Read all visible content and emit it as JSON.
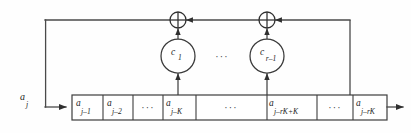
{
  "figure": {
    "type": "block-diagram",
    "background_color": "#fefefe",
    "line_color": "#4a4a4a",
    "text_color": "#1d1d1d"
  },
  "input_signal": {
    "base": "a",
    "subscript": "j",
    "label": "a_j"
  },
  "shift_register": {
    "name": "delay-line",
    "cells": [
      {
        "id": "cell-1",
        "base": "a",
        "subscript": "j–1",
        "kind": "value",
        "x": 72,
        "width": 31
      },
      {
        "id": "cell-2",
        "base": "a",
        "subscript": "j–2",
        "kind": "value",
        "x": 103,
        "width": 30
      },
      {
        "id": "cell-3",
        "base": "",
        "subscript": "",
        "kind": "ellipsis",
        "glyph": "···",
        "x": 133,
        "width": 30
      },
      {
        "id": "cell-4",
        "base": "a",
        "subscript": "j–K",
        "kind": "value",
        "x": 163,
        "width": 33
      },
      {
        "id": "cell-5",
        "base": "",
        "subscript": "",
        "kind": "ellipsis",
        "glyph": "···",
        "x": 196,
        "width": 71
      },
      {
        "id": "cell-6",
        "base": "a",
        "subscript": "j–rK+K",
        "kind": "value",
        "x": 267,
        "width": 50
      },
      {
        "id": "cell-7",
        "base": "",
        "subscript": "",
        "kind": "ellipsis",
        "glyph": "···",
        "x": 317,
        "width": 36
      },
      {
        "id": "cell-8",
        "base": "a",
        "subscript": "j–rK",
        "kind": "value",
        "x": 353,
        "width": 34
      }
    ],
    "top": 95,
    "height": 25
  },
  "coefficient_nodes": [
    {
      "id": "coef-1",
      "base": "c",
      "subscript": "1",
      "cx": 178,
      "cy": 56,
      "r": 17,
      "tap_x": 178
    },
    {
      "id": "coef-2",
      "base": "c",
      "subscript": "r–1",
      "cx": 267,
      "cy": 56,
      "r": 17,
      "tap_x": 267
    }
  ],
  "node_ellipsis": {
    "glyph": "···",
    "x": 222,
    "y": 58
  },
  "adders": [
    {
      "id": "adder-1",
      "symbol": "⊕",
      "cx": 178,
      "cy": 20,
      "r": 8
    },
    {
      "id": "adder-2",
      "symbol": "⊕",
      "cx": 267,
      "cy": 20,
      "r": 8
    }
  ],
  "feedback_path": {
    "name": "feedback-loop",
    "top_y": 20,
    "left_x": 45,
    "right_x": 350,
    "entry_y": 107
  },
  "output_arrow": {
    "name": "output-line",
    "from_x": 387,
    "to_x": 403,
    "y": 107
  }
}
